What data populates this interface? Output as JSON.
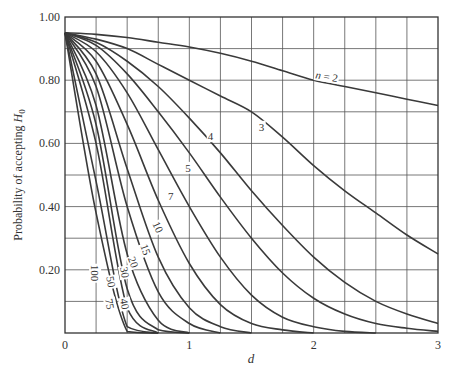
{
  "chart_data": {
    "type": "line",
    "title": "",
    "xlabel": "d",
    "ylabel": "Probability of accepting H0",
    "ylabel_parts": {
      "text": "Probability of accepting ",
      "symbol": "H",
      "subscript": "0"
    },
    "xlim": [
      0,
      3
    ],
    "ylim": [
      0,
      1
    ],
    "grid": true,
    "x_gridlines_step": 0.25,
    "y_gridlines_step": 0.1,
    "x_ticks": [
      {
        "value": 0,
        "label": "0"
      },
      {
        "value": 1,
        "label": "1"
      },
      {
        "value": 2,
        "label": "2"
      },
      {
        "value": 3,
        "label": "3"
      }
    ],
    "y_ticks": [
      {
        "value": 0.2,
        "label": "0.20"
      },
      {
        "value": 0.4,
        "label": "0.40"
      },
      {
        "value": 0.6,
        "label": "0.60"
      },
      {
        "value": 0.8,
        "label": "0.80"
      },
      {
        "value": 1.0,
        "label": "1.00"
      }
    ],
    "x": [
      0,
      0.25,
      0.5,
      0.75,
      1,
      1.25,
      1.5,
      1.75,
      2,
      2.25,
      2.5,
      2.75,
      3
    ],
    "series": [
      {
        "name": "n = 2",
        "label": "n = 2",
        "label_pos": [
          2.1,
          0.8
        ],
        "label_rot": 10,
        "values": [
          0.95,
          0.945,
          0.935,
          0.92,
          0.905,
          0.885,
          0.86,
          0.83,
          0.8,
          0.78,
          0.76,
          0.74,
          0.72
        ]
      },
      {
        "name": "n = 3",
        "label": "3",
        "label_pos": [
          1.58,
          0.64
        ],
        "label_rot": 0,
        "values": [
          0.95,
          0.93,
          0.9,
          0.85,
          0.8,
          0.75,
          0.7,
          0.62,
          0.53,
          0.45,
          0.38,
          0.31,
          0.25
        ]
      },
      {
        "name": "n = 4",
        "label": "4",
        "label_pos": [
          1.17,
          0.61
        ],
        "label_rot": 0,
        "values": [
          0.95,
          0.92,
          0.86,
          0.78,
          0.68,
          0.57,
          0.45,
          0.34,
          0.24,
          0.16,
          0.1,
          0.06,
          0.03
        ]
      },
      {
        "name": "n = 5",
        "label": "5",
        "label_pos": [
          0.99,
          0.51
        ],
        "label_rot": 0,
        "values": [
          0.95,
          0.91,
          0.82,
          0.7,
          0.57,
          0.43,
          0.3,
          0.19,
          0.11,
          0.06,
          0.03,
          0.015,
          0.005
        ]
      },
      {
        "name": "n = 7",
        "label": "7",
        "label_pos": [
          0.85,
          0.42
        ],
        "label_rot": 0,
        "values": [
          0.95,
          0.89,
          0.76,
          0.58,
          0.4,
          0.24,
          0.12,
          0.05,
          0.02,
          0.005,
          0,
          0,
          0
        ]
      },
      {
        "name": "n = 10",
        "label": "10",
        "label_pos": [
          0.72,
          0.33
        ],
        "label_rot": 65,
        "values": [
          0.95,
          0.86,
          0.66,
          0.42,
          0.22,
          0.09,
          0.03,
          0.01,
          0,
          0,
          0,
          0,
          0
        ]
      },
      {
        "name": "n = 15",
        "label": "15",
        "label_pos": [
          0.62,
          0.26
        ],
        "label_rot": 70,
        "values": [
          0.95,
          0.82,
          0.52,
          0.24,
          0.08,
          0.02,
          0,
          0,
          0,
          0,
          0,
          0,
          0
        ]
      },
      {
        "name": "n = 20",
        "label": "20",
        "label_pos": [
          0.52,
          0.22
        ],
        "label_rot": 70,
        "values": [
          0.95,
          0.78,
          0.4,
          0.13,
          0.03,
          0,
          0,
          0,
          0,
          0,
          0,
          0,
          0
        ]
      },
      {
        "name": "n = 30",
        "label": "30",
        "label_pos": [
          0.45,
          0.19
        ],
        "label_rot": 80,
        "values": [
          0.95,
          0.72,
          0.25,
          0.04,
          0,
          0,
          0,
          0,
          0,
          0,
          0,
          0,
          0
        ]
      },
      {
        "name": "n = 40",
        "label": "40",
        "label_pos": [
          0.45,
          0.09
        ],
        "label_rot": 80,
        "values": [
          0.95,
          0.66,
          0.14,
          0.01,
          0,
          0,
          0,
          0,
          0,
          0,
          0,
          0,
          0
        ]
      },
      {
        "name": "n = 50",
        "label": "50",
        "label_pos": [
          0.34,
          0.16
        ],
        "label_rot": 80,
        "values": [
          0.95,
          0.6,
          0.08,
          0,
          0,
          0,
          0,
          0,
          0,
          0,
          0,
          0,
          0
        ]
      },
      {
        "name": "n = 75",
        "label": "75",
        "label_pos": [
          0.33,
          0.09
        ],
        "label_rot": 80,
        "values": [
          0.95,
          0.48,
          0.02,
          0,
          0,
          0,
          0,
          0,
          0,
          0,
          0,
          0,
          0
        ]
      },
      {
        "name": "n = 100",
        "label": "100",
        "label_pos": [
          0.21,
          0.19
        ],
        "label_rot": 90,
        "values": [
          0.95,
          0.38,
          0.005,
          0,
          0,
          0,
          0,
          0,
          0,
          0,
          0,
          0,
          0
        ]
      }
    ],
    "line_color": "#3a3a3a",
    "grid_color": "#555555",
    "legend": "inline labels on curves"
  }
}
